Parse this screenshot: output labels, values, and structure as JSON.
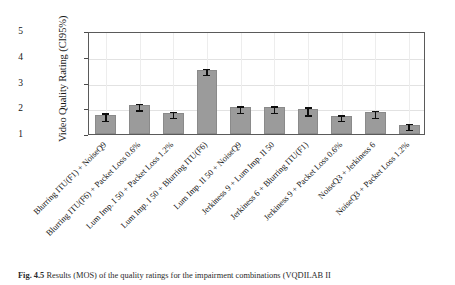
{
  "figure": {
    "caption_label": "Fig. 4.5",
    "caption_text": "Results (MOS) of the quality ratings for the impairment combinations (VQDILAB II"
  },
  "chart_data": {
    "type": "bar",
    "title": "",
    "subtitle": "",
    "xlabel": "",
    "ylabel": "Video Quality Rating (CI95%)",
    "ylim": [
      1,
      5
    ],
    "yticks": [
      1,
      2,
      3,
      4,
      5
    ],
    "ytick_labels": [
      "1",
      "2",
      "3",
      "4",
      "5"
    ],
    "grid": true,
    "legend": "none",
    "error_type": "CI95%",
    "categories": [
      "Blurring ITU(F1) + NoiseQ9",
      "Blurring ITU(F6) + Packet Loss 0.6%",
      "Lum Imp. I 50 + Packet Loss 1.2%",
      "Lum Imp. I 50 + Blurring ITU(F6)",
      "Lum Imp. II 50 + NoiseQ9",
      "Jerkiness 9  + Lum Imp. II 50",
      "Jerkiness 6 + Blurring ITU(F1)",
      "Jerkiness 9 + Packet Loss 0.6%",
      "NoiseQ3 + Jerkiness 6",
      "NoiseQ3 + Packet Loss 1.2%"
    ],
    "values": [
      1.73,
      2.13,
      1.82,
      3.5,
      2.03,
      2.03,
      1.96,
      1.7,
      1.84,
      1.36
    ],
    "errors": [
      0.15,
      0.13,
      0.11,
      0.12,
      0.12,
      0.13,
      0.15,
      0.11,
      0.13,
      0.11
    ],
    "bar_color": "#9b9b9b",
    "error_color": "#0d0d0d"
  }
}
